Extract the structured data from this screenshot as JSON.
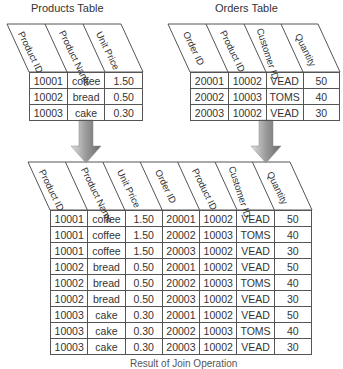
{
  "products_table": {
    "title": "Products Table",
    "columns": [
      "Product ID",
      "Product Name",
      "Unit Price"
    ],
    "rows": [
      [
        "10001",
        "coffee",
        "1.50"
      ],
      [
        "10002",
        "bread",
        "0.50"
      ],
      [
        "10003",
        "cake",
        "0.30"
      ]
    ]
  },
  "orders_table": {
    "title": "Orders Table",
    "columns": [
      "Order ID",
      "Product ID",
      "Customer ID",
      "Quantity"
    ],
    "rows": [
      [
        "20001",
        "10002",
        "VEAD",
        "50"
      ],
      [
        "20002",
        "10003",
        "TOMS",
        "40"
      ],
      [
        "20003",
        "10002",
        "VEAD",
        "30"
      ]
    ]
  },
  "result_table": {
    "columns": [
      "Product ID",
      "Product Name",
      "Unit Price",
      "Order ID",
      "Product ID",
      "Customer ID",
      "Quantity"
    ],
    "rows": [
      [
        "10001",
        "coffee",
        "1.50",
        "20001",
        "10002",
        "VEAD",
        "50"
      ],
      [
        "10001",
        "coffee",
        "1.50",
        "20002",
        "10003",
        "TOMS",
        "40"
      ],
      [
        "10001",
        "coffee",
        "1.50",
        "20003",
        "10002",
        "VEAD",
        "30"
      ],
      [
        "10002",
        "bread",
        "0.50",
        "20001",
        "10002",
        "VEAD",
        "50"
      ],
      [
        "10002",
        "bread",
        "0.50",
        "20002",
        "10003",
        "TOMS",
        "40"
      ],
      [
        "10002",
        "bread",
        "0.50",
        "20003",
        "10002",
        "VEAD",
        "30"
      ],
      [
        "10003",
        "cake",
        "0.30",
        "20001",
        "10002",
        "VEAD",
        "50"
      ],
      [
        "10003",
        "cake",
        "0.30",
        "20002",
        "10003",
        "TOMS",
        "40"
      ],
      [
        "10003",
        "cake",
        "0.30",
        "20003",
        "10002",
        "VEAD",
        "30"
      ]
    ],
    "caption": "Result of Join Operation"
  },
  "colors": {
    "line": "#555555",
    "text": "#333333",
    "arrow_light": "#d0d0d0",
    "arrow_dark": "#7a7a7a"
  }
}
